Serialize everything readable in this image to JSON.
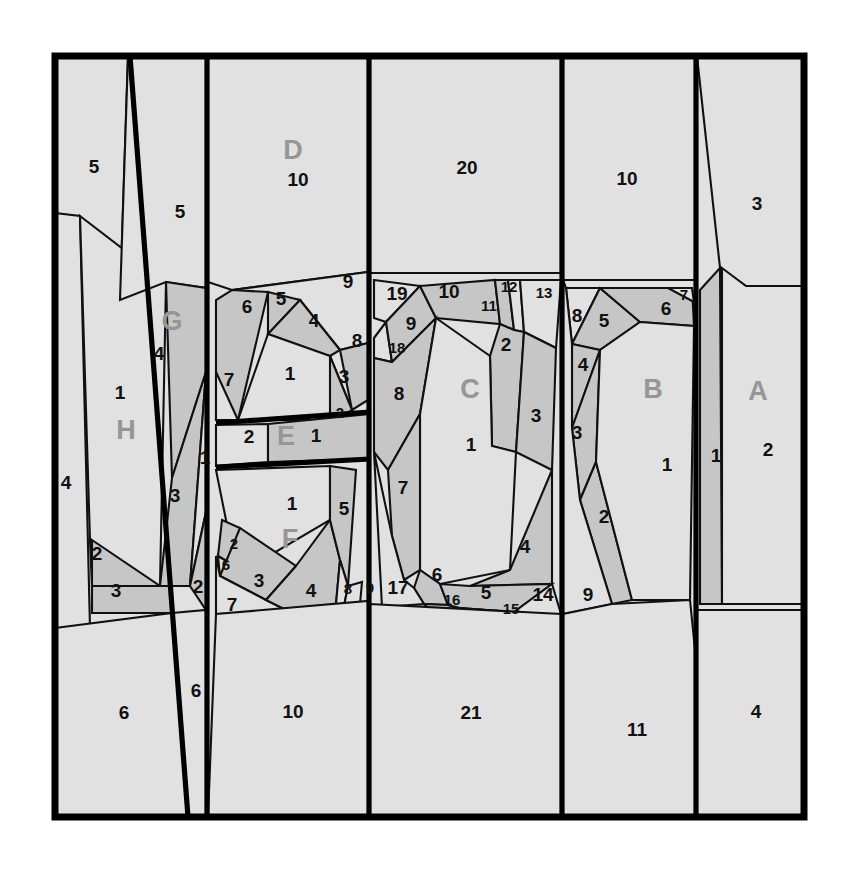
{
  "figure": {
    "kind": "geometric-dissection-diagram",
    "frame": {
      "x": 52,
      "y": 53,
      "width": 755,
      "height": 767
    },
    "colors": {
      "background": "#ffffff",
      "fill_light": "#e1e1e1",
      "fill_dark": "#c6c6c6",
      "stroke": "#111111",
      "frame_stroke": "#000000",
      "number_text": "#111111",
      "letter_text": "#969696"
    },
    "group_letters": [
      {
        "id": "A",
        "label": "A",
        "x": 758,
        "y": 393
      },
      {
        "id": "B",
        "label": "B",
        "x": 653,
        "y": 391
      },
      {
        "id": "C",
        "label": "C",
        "x": 470,
        "y": 391
      },
      {
        "id": "D",
        "label": "D",
        "x": 293,
        "y": 152
      },
      {
        "id": "E",
        "label": "E",
        "x": 286,
        "y": 438
      },
      {
        "id": "F",
        "label": "F",
        "x": 290,
        "y": 541
      },
      {
        "id": "G",
        "label": "G",
        "x": 172,
        "y": 323
      },
      {
        "id": "H",
        "label": "H",
        "x": 126,
        "y": 432
      }
    ],
    "numbered_pieces": [
      {
        "n": "5",
        "x": 94,
        "y": 168,
        "size": "lg"
      },
      {
        "n": "5",
        "x": 180,
        "y": 213,
        "size": "lg"
      },
      {
        "n": "10",
        "x": 298,
        "y": 181,
        "size": "lg"
      },
      {
        "n": "20",
        "x": 467,
        "y": 169,
        "size": "lg"
      },
      {
        "n": "10",
        "x": 627,
        "y": 180,
        "size": "lg"
      },
      {
        "n": "3",
        "x": 757,
        "y": 205,
        "size": "lg"
      },
      {
        "n": "9",
        "x": 348,
        "y": 283,
        "size": "lg"
      },
      {
        "n": "6",
        "x": 247,
        "y": 308,
        "size": "lg"
      },
      {
        "n": "5",
        "x": 281,
        "y": 300,
        "size": "lg"
      },
      {
        "n": "4",
        "x": 314,
        "y": 322,
        "size": "lg"
      },
      {
        "n": "8",
        "x": 357,
        "y": 342,
        "size": "lg"
      },
      {
        "n": "7",
        "x": 229,
        "y": 381,
        "size": "lg"
      },
      {
        "n": "1",
        "x": 290,
        "y": 375,
        "size": "lg"
      },
      {
        "n": "3",
        "x": 344,
        "y": 378,
        "size": "lg"
      },
      {
        "n": "2",
        "x": 340,
        "y": 414,
        "size": "sm"
      },
      {
        "n": "2",
        "x": 249,
        "y": 438,
        "size": "lg"
      },
      {
        "n": "1",
        "x": 316,
        "y": 437,
        "size": "lg"
      },
      {
        "n": "19",
        "x": 397,
        "y": 295,
        "size": "lg"
      },
      {
        "n": "10",
        "x": 449,
        "y": 293,
        "size": "lg"
      },
      {
        "n": "11",
        "x": 489,
        "y": 307,
        "size": "sm"
      },
      {
        "n": "12",
        "x": 509,
        "y": 288,
        "size": "sm"
      },
      {
        "n": "13",
        "x": 544,
        "y": 294,
        "size": "sm"
      },
      {
        "n": "9",
        "x": 411,
        "y": 325,
        "size": "lg"
      },
      {
        "n": "18",
        "x": 397,
        "y": 349,
        "size": "sm"
      },
      {
        "n": "2",
        "x": 506,
        "y": 346,
        "size": "lg"
      },
      {
        "n": "8",
        "x": 399,
        "y": 395,
        "size": "lg"
      },
      {
        "n": "1",
        "x": 471,
        "y": 446,
        "size": "lg"
      },
      {
        "n": "3",
        "x": 536,
        "y": 417,
        "size": "lg"
      },
      {
        "n": "7",
        "x": 403,
        "y": 489,
        "size": "lg"
      },
      {
        "n": "6",
        "x": 437,
        "y": 576,
        "size": "lg"
      },
      {
        "n": "17",
        "x": 398,
        "y": 589,
        "size": "lg"
      },
      {
        "n": "16",
        "x": 452,
        "y": 601,
        "size": "sm"
      },
      {
        "n": "5",
        "x": 486,
        "y": 594,
        "size": "lg"
      },
      {
        "n": "15",
        "x": 511,
        "y": 610,
        "size": "sm"
      },
      {
        "n": "14",
        "x": 543,
        "y": 596,
        "size": "lg"
      },
      {
        "n": "4",
        "x": 525,
        "y": 548,
        "size": "lg"
      },
      {
        "n": "9",
        "x": 370,
        "y": 589,
        "size": "sm"
      },
      {
        "n": "8",
        "x": 348,
        "y": 590,
        "size": "sm"
      },
      {
        "n": "4",
        "x": 311,
        "y": 592,
        "size": "lg"
      },
      {
        "n": "8",
        "x": 577,
        "y": 317,
        "size": "lg"
      },
      {
        "n": "5",
        "x": 604,
        "y": 322,
        "size": "lg"
      },
      {
        "n": "6",
        "x": 666,
        "y": 310,
        "size": "lg"
      },
      {
        "n": "7",
        "x": 684,
        "y": 296,
        "size": "sm"
      },
      {
        "n": "4",
        "x": 583,
        "y": 366,
        "size": "lg"
      },
      {
        "n": "3",
        "x": 577,
        "y": 434,
        "size": "lg"
      },
      {
        "n": "1",
        "x": 667,
        "y": 466,
        "size": "lg"
      },
      {
        "n": "2",
        "x": 604,
        "y": 518,
        "size": "lg"
      },
      {
        "n": "9",
        "x": 588,
        "y": 596,
        "size": "lg"
      },
      {
        "n": "1",
        "x": 716,
        "y": 457,
        "size": "lg"
      },
      {
        "n": "2",
        "x": 768,
        "y": 451,
        "size": "lg"
      },
      {
        "n": "1",
        "x": 120,
        "y": 394,
        "size": "lg"
      },
      {
        "n": "4",
        "x": 159,
        "y": 355,
        "size": "lg"
      },
      {
        "n": "4",
        "x": 66,
        "y": 484,
        "size": "lg"
      },
      {
        "n": "1",
        "x": 205,
        "y": 459,
        "size": "lg"
      },
      {
        "n": "3",
        "x": 175,
        "y": 497,
        "size": "lg"
      },
      {
        "n": "2",
        "x": 97,
        "y": 555,
        "size": "lg"
      },
      {
        "n": "3",
        "x": 116,
        "y": 592,
        "size": "lg"
      },
      {
        "n": "2",
        "x": 198,
        "y": 588,
        "size": "lg"
      },
      {
        "n": "2",
        "x": 234,
        "y": 545,
        "size": "sm"
      },
      {
        "n": "6",
        "x": 226,
        "y": 566,
        "size": "sm"
      },
      {
        "n": "3",
        "x": 259,
        "y": 582,
        "size": "lg"
      },
      {
        "n": "7",
        "x": 232,
        "y": 606,
        "size": "lg"
      },
      {
        "n": "1",
        "x": 292,
        "y": 505,
        "size": "lg"
      },
      {
        "n": "5",
        "x": 344,
        "y": 510,
        "size": "lg"
      },
      {
        "n": "6",
        "x": 124,
        "y": 714,
        "size": "lg"
      },
      {
        "n": "6",
        "x": 196,
        "y": 692,
        "size": "lg"
      },
      {
        "n": "10",
        "x": 293,
        "y": 713,
        "size": "lg"
      },
      {
        "n": "21",
        "x": 471,
        "y": 714,
        "size": "lg"
      },
      {
        "n": "11",
        "x": 637,
        "y": 731,
        "size": "lg"
      },
      {
        "n": "4",
        "x": 756,
        "y": 713,
        "size": "lg"
      }
    ]
  }
}
